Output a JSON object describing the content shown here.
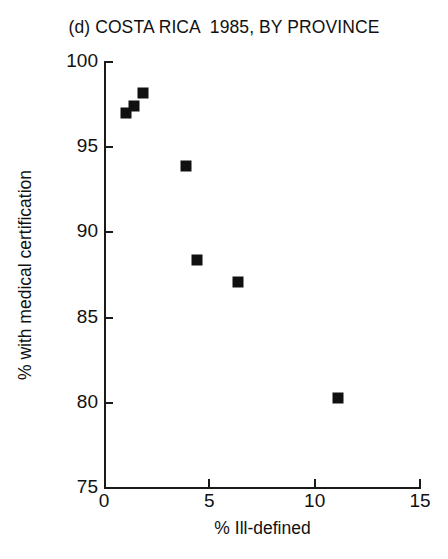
{
  "chart_data": {
    "type": "scatter",
    "title": "(d) COSTA RICA  1985, BY PROVINCE",
    "xlabel": "% Ill-defined",
    "ylabel": "% with medical certification",
    "xlim": [
      0,
      15
    ],
    "ylim": [
      75,
      100
    ],
    "xticks": [
      0,
      5,
      10,
      15
    ],
    "yticks": [
      75,
      80,
      85,
      90,
      95,
      100
    ],
    "xtick_labels": [
      "0",
      "5",
      "10",
      "15"
    ],
    "ytick_labels": [
      "75",
      "80",
      "85",
      "90",
      "95",
      "100"
    ],
    "grid": false,
    "legend": null,
    "marker": "filled-square",
    "marker_color": "#101010",
    "series": [
      {
        "name": "Provinces",
        "points": [
          {
            "x": 1.85,
            "y": 98.2
          },
          {
            "x": 1.42,
            "y": 97.4
          },
          {
            "x": 1.04,
            "y": 97.0
          },
          {
            "x": 3.9,
            "y": 93.9
          },
          {
            "x": 4.4,
            "y": 88.4
          },
          {
            "x": 6.35,
            "y": 87.1
          },
          {
            "x": 11.1,
            "y": 80.3
          }
        ]
      }
    ]
  }
}
